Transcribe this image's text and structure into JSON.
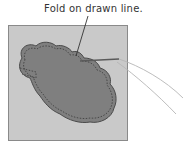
{
  "caption": "Fold on drawn line.",
  "colors": {
    "background": "#ffffff",
    "fabric": "#c9c9c9",
    "fabric_border": "#8a8a8a",
    "shape_fill": "#7f7f7f",
    "shape_outline": "#4a4a4a",
    "stitch_line": "#3a3a3a",
    "thread": "#b5b5b5",
    "needle": "#5a5a5a"
  }
}
